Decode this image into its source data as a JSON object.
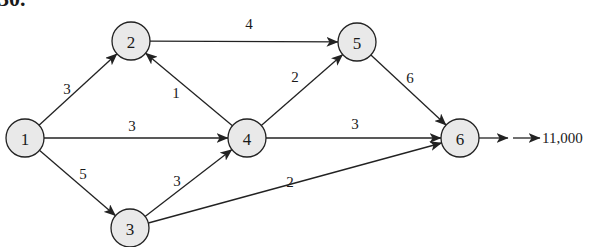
{
  "problem": {
    "number": "30."
  },
  "colors": {
    "node_fill": "#e9e9e9",
    "stroke": "#222222",
    "text": "#1a1a1a"
  },
  "node_radius": 19,
  "nodes": [
    {
      "id": "1",
      "label": "1",
      "x": 25,
      "y": 138
    },
    {
      "id": "2",
      "label": "2",
      "x": 131,
      "y": 41
    },
    {
      "id": "3",
      "label": "3",
      "x": 130,
      "y": 228
    },
    {
      "id": "4",
      "label": "4",
      "x": 247,
      "y": 138
    },
    {
      "id": "5",
      "label": "5",
      "x": 357,
      "y": 42
    },
    {
      "id": "6",
      "label": "6",
      "x": 460,
      "y": 138
    }
  ],
  "edges": [
    {
      "from": "1",
      "to": "2",
      "capacity": "3",
      "label_x": 67,
      "label_y": 89
    },
    {
      "from": "1",
      "to": "4",
      "capacity": "3",
      "label_x": 132,
      "label_y": 126
    },
    {
      "from": "1",
      "to": "3",
      "capacity": "5",
      "label_x": 83,
      "label_y": 174
    },
    {
      "from": "2",
      "to": "5",
      "capacity": "4",
      "label_x": 249,
      "label_y": 24
    },
    {
      "from": "4",
      "to": "2",
      "capacity": "1",
      "label_x": 176,
      "label_y": 93
    },
    {
      "from": "4",
      "to": "5",
      "capacity": "2",
      "label_x": 295,
      "label_y": 77
    },
    {
      "from": "4",
      "to": "6",
      "capacity": "3",
      "label_x": 355,
      "label_y": 124
    },
    {
      "from": "3",
      "to": "4",
      "capacity": "3",
      "label_x": 177,
      "label_y": 181
    },
    {
      "from": "3",
      "to": "6",
      "capacity": "2",
      "label_x": 290,
      "label_y": 182
    },
    {
      "from": "5",
      "to": "6",
      "capacity": "6",
      "label_x": 410,
      "label_y": 78
    }
  ],
  "output": {
    "from": "6",
    "label": "11,000",
    "segments": [
      {
        "x1": 479,
        "y1": 138,
        "x2": 508
      },
      {
        "x1": 513,
        "y1": 138,
        "x2": 540
      }
    ],
    "label_x": 542,
    "label_y": 138
  }
}
